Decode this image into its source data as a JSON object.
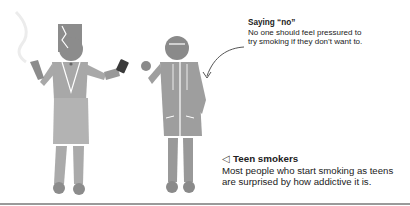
{
  "captions": {
    "saying_no": {
      "title": "Saying “no”",
      "body_line1": "No one should feel pressured to",
      "body_line2": "try smoking if they don’t want to."
    },
    "teen_smokers": {
      "pointer_glyph": "◁",
      "title": "Teen smokers",
      "body_line1": "Most people who start smoking as teens",
      "body_line2": "are surprised by how addictive it is."
    }
  },
  "colors": {
    "figure_light": "#b3b3b3",
    "figure_mid": "#9e9e9e",
    "figure_dark": "#8a8a8a",
    "phone": "#3a3a3a",
    "rule": "#9a9a9a"
  }
}
